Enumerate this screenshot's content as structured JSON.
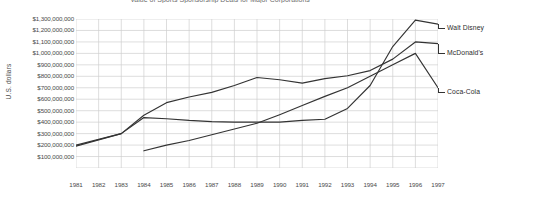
{
  "chart_data": {
    "type": "line",
    "title": "Value of Sports Sponsorship Deals for Major Corporations",
    "xlabel": "",
    "ylabel": "U.S. dollars",
    "x": [
      1981,
      1982,
      1983,
      1984,
      1985,
      1986,
      1987,
      1988,
      1989,
      1990,
      1991,
      1992,
      1993,
      1994,
      1995,
      1996,
      1997
    ],
    "xticklabels": [
      "1981",
      "1982",
      "1983",
      "1984",
      "1985",
      "1986",
      "1987",
      "1988",
      "1989",
      "1990",
      "1991",
      "1992",
      "1993",
      "1994",
      "1995",
      "1996",
      "1997"
    ],
    "yticklabels": [
      "$1,300,000,000",
      "$1,200,000,000",
      "$1,100,000,000",
      "$1,000,000,000",
      "$900,000,000",
      "$800,000,000",
      "$700,000,000",
      "$600,000,000",
      "$500,000,000",
      "$400,000,000",
      "$300,000,000",
      "$200,000,000",
      "$100,000,000"
    ],
    "ytickvalues": [
      1300000000,
      1200000000,
      1100000000,
      1000000000,
      900000000,
      800000000,
      700000000,
      600000000,
      500000000,
      400000000,
      300000000,
      200000000,
      100000000
    ],
    "ylim": [
      0,
      1300000000
    ],
    "xlim": [
      1981,
      1997
    ],
    "grid": true,
    "legend_position": "right-inline",
    "line_color": "#333333",
    "grid_color": "#cfcfcf",
    "series": [
      {
        "name": "Walt Disney",
        "label": "Walt Disney",
        "x": [
          1981,
          1982,
          1983,
          1984,
          1985,
          1986,
          1987,
          1988,
          1989,
          1990,
          1991,
          1992,
          1993,
          1994,
          1995,
          1996,
          1997
        ],
        "values": [
          200000000,
          250000000,
          300000000,
          440000000,
          430000000,
          415000000,
          405000000,
          400000000,
          400000000,
          400000000,
          415000000,
          425000000,
          520000000,
          720000000,
          1060000000,
          1290000000,
          1255000000
        ]
      },
      {
        "name": "McDonald's",
        "label": "McDonald's",
        "x": [
          1981,
          1982,
          1983,
          1984,
          1985,
          1986,
          1987,
          1988,
          1989,
          1990,
          1991,
          1992,
          1993,
          1994,
          1995,
          1996,
          1997
        ],
        "values": [
          190000000,
          245000000,
          300000000,
          460000000,
          570000000,
          620000000,
          660000000,
          720000000,
          790000000,
          770000000,
          740000000,
          780000000,
          805000000,
          850000000,
          950000000,
          1100000000,
          1085000000
        ]
      },
      {
        "name": "Coca-Cola",
        "label": "Coca-Cola",
        "x": [
          1984,
          1985,
          1986,
          1987,
          1988,
          1989,
          1990,
          1991,
          1992,
          1993,
          1994,
          1995,
          1996,
          1997
        ],
        "values": [
          150000000,
          200000000,
          240000000,
          290000000,
          340000000,
          390000000,
          465000000,
          545000000,
          625000000,
          700000000,
          800000000,
          900000000,
          1000000000,
          700000000
        ]
      }
    ],
    "series_label_positions": [
      {
        "name": "Walt Disney",
        "left": 447,
        "top": 24
      },
      {
        "name": "McDonald's",
        "left": 447,
        "top": 49
      },
      {
        "name": "Coca-Cola",
        "left": 447,
        "top": 88
      }
    ]
  }
}
